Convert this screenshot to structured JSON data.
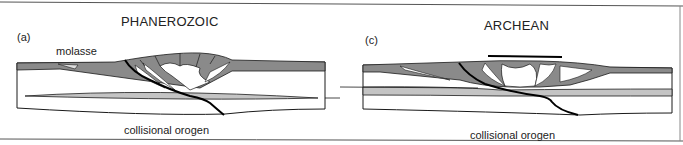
{
  "figure": {
    "panels": [
      {
        "id": "(a)",
        "title": "PHANEROZOIC",
        "labels": {
          "upper_left": "molasse",
          "caption": "collisional orogen"
        }
      },
      {
        "id": "(c)",
        "title": "ARCHEAN",
        "labels": {
          "caption": "collisional orogen"
        }
      }
    ],
    "colors": {
      "dark_layer": "#8a8a8a",
      "light_layer": "#c4c4c4",
      "outline": "#1a1a1a",
      "fault": "#000000",
      "background": "#ffffff"
    }
  }
}
